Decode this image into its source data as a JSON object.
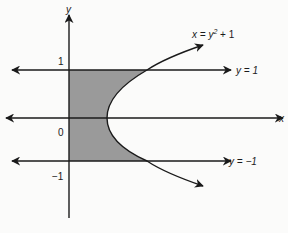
{
  "diagram": {
    "type": "region-between-curves",
    "axes": {
      "x_label": "x",
      "y_label": "y"
    },
    "ticks": {
      "y_pos": "1",
      "origin": "0",
      "y_neg": "−1"
    },
    "curves": {
      "parabola_label": "x = y² + 1",
      "parabola_lhs": "x = y",
      "parabola_exp": "2",
      "parabola_rhs": " + 1",
      "line_top_label": "y = 1",
      "line_bottom_label": "y = −1"
    },
    "colors": {
      "shade": "#9a9a9a",
      "stroke": "#1a1a1a",
      "background": "#fbfbfa"
    }
  }
}
